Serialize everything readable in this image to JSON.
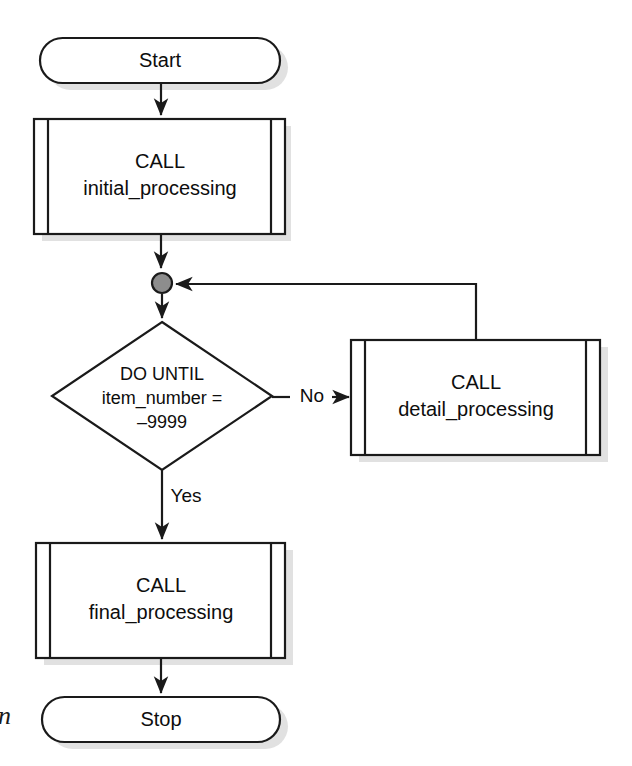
{
  "diagram": {
    "background_color": "#ffffff",
    "line_color": "#1a1a1a",
    "junction_color": "#8d8d8d",
    "shadow_color": "#c9c9c9"
  },
  "nodes": {
    "start": {
      "label": "Start",
      "shape": "terminator"
    },
    "initial_processing": {
      "line1": "CALL",
      "line2": "initial_processing",
      "shape": "predefined-process"
    },
    "junction": {
      "label": "",
      "shape": "connector-dot"
    },
    "decision": {
      "line1": "DO UNTIL",
      "line2": "item_number =",
      "line3": "–9999",
      "shape": "decision"
    },
    "detail_processing": {
      "line1": "CALL",
      "line2": "detail_processing",
      "shape": "predefined-process"
    },
    "final_processing": {
      "line1": "CALL",
      "line2": "final_processing",
      "shape": "predefined-process"
    },
    "stop": {
      "label": "Stop",
      "shape": "terminator"
    }
  },
  "edges": {
    "no_label": "No",
    "yes_label": "Yes"
  },
  "margin": {
    "partial_glyph": "n"
  }
}
